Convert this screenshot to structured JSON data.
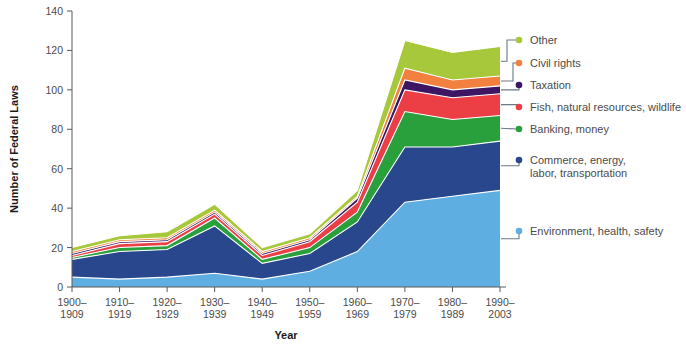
{
  "chart_data": {
    "type": "area",
    "stacked": true,
    "title": "",
    "xlabel": "Year",
    "ylabel": "Number of Federal Laws",
    "categories": [
      "1900–1909",
      "1910–1919",
      "1920–1929",
      "1930–1939",
      "1940–1949",
      "1950–1959",
      "1960–1969",
      "1970–1979",
      "1980–1989",
      "1990–2003"
    ],
    "category_lines": [
      [
        "1900–",
        "1909"
      ],
      [
        "1910–",
        "1919"
      ],
      [
        "1920–",
        "1929"
      ],
      [
        "1930–",
        "1939"
      ],
      [
        "1940–",
        "1949"
      ],
      [
        "1950–",
        "1959"
      ],
      [
        "1960–",
        "1969"
      ],
      [
        "1970–",
        "1979"
      ],
      [
        "1980–",
        "1989"
      ],
      [
        "1990–",
        "2003"
      ]
    ],
    "ylim": [
      0,
      140
    ],
    "yticks": [
      0,
      20,
      40,
      60,
      80,
      100,
      120,
      140
    ],
    "ytick_labels": [
      "0",
      "20",
      "40",
      "60",
      "80",
      "100",
      "120",
      "140"
    ],
    "grid": false,
    "legend_position": "right",
    "series": [
      {
        "name": "Environment, health, safety",
        "color": "#5eaee2",
        "values": [
          5,
          4,
          5,
          7,
          4,
          8,
          18,
          43,
          46,
          49
        ]
      },
      {
        "name": "Commerce, energy, labor, transportation",
        "color": "#28478c",
        "values": [
          9,
          14,
          14,
          24,
          8,
          9,
          15,
          28,
          25,
          25
        ]
      },
      {
        "name": "Banking, money",
        "color": "#2aa03c",
        "values": [
          1,
          2,
          2,
          4,
          2,
          3,
          5,
          18,
          14,
          13
        ]
      },
      {
        "name": "Fish, natural resources, wildlife",
        "color": "#ec3f45",
        "values": [
          1,
          2,
          2,
          2,
          2,
          3,
          5,
          11,
          11,
          11
        ]
      },
      {
        "name": "Taxation",
        "color": "#3d1663",
        "values": [
          1,
          1,
          1,
          1,
          1,
          1,
          2,
          5,
          4,
          4
        ]
      },
      {
        "name": "Civil rights",
        "color": "#f2813f",
        "values": [
          1,
          1,
          1,
          1,
          1,
          1,
          1,
          6,
          5,
          5
        ]
      },
      {
        "name": "Other",
        "color": "#a8c83c",
        "values": [
          2,
          2,
          3,
          3,
          2,
          2,
          3,
          14,
          14,
          15
        ]
      }
    ],
    "totals": [
      20,
      26,
      28,
      42,
      20,
      27,
      49,
      125,
      119,
      122
    ]
  },
  "legend": {
    "entries": [
      {
        "label": "Other",
        "color": "#a8c83c"
      },
      {
        "label": "Civil rights",
        "color": "#f2813f"
      },
      {
        "label": "Taxation",
        "color": "#3d1663"
      },
      {
        "label": "Fish, natural resources, wildlife",
        "color": "#ec3f45"
      },
      {
        "label": "Banking, money",
        "color": "#2aa03c"
      },
      {
        "label": "Commerce, energy,",
        "label2": "labor, transportation",
        "color": "#28478c"
      },
      {
        "label": "Environment, health, safety",
        "color": "#5eaee2"
      }
    ]
  }
}
